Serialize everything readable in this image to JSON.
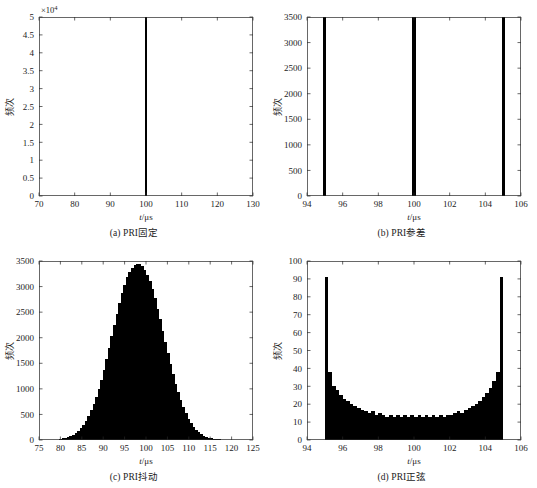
{
  "figure": {
    "panels": [
      {
        "id": "a",
        "caption": "(a) PRI固定",
        "xlabel_it": "t",
        "xlabel_rest": "/μs",
        "ylabel": "频次",
        "exponent": "×10",
        "exponent_sup": "4"
      },
      {
        "id": "b",
        "caption": "(b) PRI参差",
        "xlabel_it": "t",
        "xlabel_rest": "/μs",
        "ylabel": "频次",
        "exponent": "",
        "exponent_sup": ""
      },
      {
        "id": "c",
        "caption": "(c) PRI抖动",
        "xlabel_it": "t",
        "xlabel_rest": "/μs",
        "ylabel": "频次",
        "exponent": "",
        "exponent_sup": ""
      },
      {
        "id": "d",
        "caption": "(d) PRI正弦",
        "xlabel_it": "t",
        "xlabel_rest": "/μs",
        "ylabel": "频次",
        "exponent": "",
        "exponent_sup": ""
      }
    ]
  },
  "chart_data": [
    {
      "type": "bar",
      "panel": "a",
      "title": "(a) PRI固定",
      "xlabel": "t/μs",
      "ylabel": "频次",
      "xlim": [
        70,
        130
      ],
      "ylim": [
        0,
        50000
      ],
      "y_scale_exponent": 4,
      "xticks": [
        70,
        80,
        90,
        100,
        110,
        120,
        130
      ],
      "yticks": [
        0,
        5000,
        10000,
        15000,
        20000,
        25000,
        30000,
        35000,
        40000,
        45000,
        50000
      ],
      "ytick_labels": [
        "0",
        "0.5",
        "1",
        "1.5",
        "2",
        "2.5",
        "3",
        "3.5",
        "4",
        "4.5",
        "5"
      ],
      "grid": false,
      "bar_width": 0.8,
      "x": [
        100
      ],
      "values": [
        50000
      ],
      "color": "#000000"
    },
    {
      "type": "bar",
      "panel": "b",
      "title": "(b) PRI参差",
      "xlabel": "t/μs",
      "ylabel": "频次",
      "xlim": [
        94,
        106
      ],
      "ylim": [
        0,
        3500
      ],
      "xticks": [
        94,
        96,
        98,
        100,
        102,
        104,
        106
      ],
      "yticks": [
        0,
        500,
        1000,
        1500,
        2000,
        2500,
        3000,
        3500
      ],
      "grid": false,
      "bar_width": 0.17,
      "x": [
        95,
        100,
        105
      ],
      "values": [
        3500,
        3500,
        3500
      ],
      "color": "#000000"
    },
    {
      "type": "bar",
      "panel": "c",
      "title": "(c) PRI抖动",
      "xlabel": "t/μs",
      "ylabel": "频次",
      "xlim": [
        75,
        125
      ],
      "ylim": [
        0,
        3500
      ],
      "xticks": [
        75,
        80,
        85,
        90,
        95,
        100,
        105,
        110,
        115,
        120,
        125
      ],
      "yticks": [
        0,
        500,
        1000,
        1500,
        2000,
        2500,
        3000,
        3500
      ],
      "grid": false,
      "bar_width": 0.6,
      "x": [
        80.0,
        80.6,
        81.2,
        81.8,
        82.4,
        83.0,
        83.6,
        84.2,
        84.8,
        85.4,
        86.0,
        86.6,
        87.2,
        87.8,
        88.4,
        89.0,
        89.6,
        90.2,
        90.8,
        91.4,
        92.0,
        92.6,
        93.2,
        93.8,
        94.4,
        95.0,
        95.6,
        96.2,
        96.8,
        97.4,
        98.0,
        98.6,
        99.2,
        99.8,
        100.4,
        101.0,
        101.6,
        102.2,
        102.8,
        103.4,
        104.0,
        104.6,
        105.2,
        105.8,
        106.4,
        107.0,
        107.6,
        108.2,
        108.8,
        109.4,
        110.0,
        110.6,
        111.2,
        111.8,
        112.4,
        113.0,
        113.6,
        114.2,
        114.8,
        115.4,
        116.0,
        116.6,
        117.2,
        117.8
      ],
      "values": [
        20,
        30,
        45,
        60,
        80,
        105,
        140,
        180,
        230,
        300,
        380,
        470,
        580,
        700,
        840,
        1000,
        1180,
        1370,
        1580,
        1800,
        2030,
        2250,
        2470,
        2680,
        2880,
        3040,
        3180,
        3290,
        3370,
        3430,
        3450,
        3440,
        3400,
        3330,
        3230,
        3100,
        2950,
        2770,
        2570,
        2360,
        2140,
        1920,
        1700,
        1490,
        1290,
        1100,
        930,
        780,
        640,
        520,
        420,
        330,
        260,
        200,
        155,
        115,
        85,
        62,
        45,
        32,
        22,
        15,
        10,
        6
      ],
      "color": "#000000",
      "distribution": "gaussian",
      "mean": 100,
      "peak_value": 3450
    },
    {
      "type": "bar",
      "panel": "d",
      "title": "(d) PRI正弦",
      "xlabel": "t/μs",
      "ylabel": "频次",
      "xlim": [
        94,
        106
      ],
      "ylim": [
        0,
        100
      ],
      "xticks": [
        94,
        96,
        98,
        100,
        102,
        104,
        106
      ],
      "yticks": [
        0,
        10,
        20,
        30,
        40,
        50,
        60,
        70,
        80,
        90,
        100
      ],
      "grid": false,
      "bar_width": 0.2,
      "x": [
        95.1,
        95.3,
        95.5,
        95.7,
        95.9,
        96.1,
        96.3,
        96.5,
        96.7,
        96.9,
        97.1,
        97.3,
        97.5,
        97.7,
        97.9,
        98.1,
        98.3,
        98.5,
        98.7,
        98.9,
        99.1,
        99.3,
        99.5,
        99.7,
        99.9,
        100.1,
        100.3,
        100.5,
        100.7,
        100.9,
        101.1,
        101.3,
        101.5,
        101.7,
        101.9,
        102.1,
        102.3,
        102.5,
        102.7,
        102.9,
        103.1,
        103.3,
        103.5,
        103.7,
        103.9,
        104.1,
        104.3,
        104.5,
        104.7,
        104.9
      ],
      "values": [
        91,
        38,
        30,
        28,
        25,
        23,
        22,
        20,
        19,
        18,
        17,
        16,
        15,
        16,
        14,
        15,
        14,
        13,
        14,
        13,
        14,
        13,
        14,
        13,
        14,
        13,
        14,
        13,
        14,
        13,
        14,
        13,
        14,
        13,
        14,
        14,
        15,
        16,
        15,
        17,
        18,
        19,
        20,
        22,
        24,
        26,
        29,
        33,
        38,
        91
      ],
      "color": "#000000",
      "distribution": "arcsine",
      "range": [
        95,
        105
      ],
      "edge_peak": 91,
      "floor": 13
    }
  ]
}
